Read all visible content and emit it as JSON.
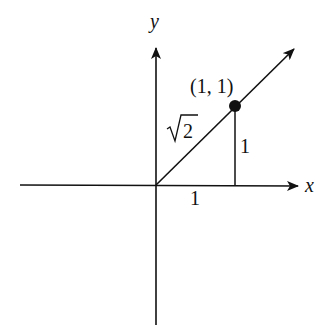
{
  "diagram": {
    "axes": {
      "x_label": "x",
      "y_label": "y"
    },
    "point": {
      "label": "(1, 1)",
      "x": 1,
      "y": 1
    },
    "segment_labels": {
      "hypotenuse": "√2",
      "hypotenuse_radicand": "2",
      "vertical_leg": "1",
      "horizontal_leg": "1"
    },
    "colors": {
      "stroke": "#111111",
      "background": "#ffffff"
    }
  }
}
